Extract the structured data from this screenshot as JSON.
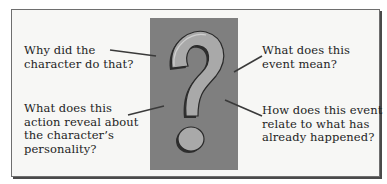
{
  "diagram": {
    "central_graphic": {
      "icon": "question-mark-icon",
      "panel_color": "#7f7f7f",
      "glyph_color": "#a9a9a9",
      "outline_color": "#2a2a2a"
    },
    "questions": [
      {
        "position": "top-left",
        "text": "Why did the character do that?",
        "lines": [
          "Why did the",
          "character do that?"
        ]
      },
      {
        "position": "top-right",
        "text": "What does this event mean?",
        "lines": [
          "What does this",
          "event mean?"
        ]
      },
      {
        "position": "bottom-left",
        "text": "What does this action reveal about the character's personality?",
        "lines": [
          "What does this",
          "action reveal about",
          "the character’s",
          "personality?"
        ]
      },
      {
        "position": "bottom-right",
        "text": "How does this event relate to what has already happened?",
        "lines": [
          "How does this event",
          "relate to what has",
          "already happened?"
        ]
      }
    ],
    "colors": {
      "background": "#f7f7f5",
      "border": "#6e6e6e",
      "text": "#1e1e1e",
      "connector": "#3a3a3a"
    }
  }
}
